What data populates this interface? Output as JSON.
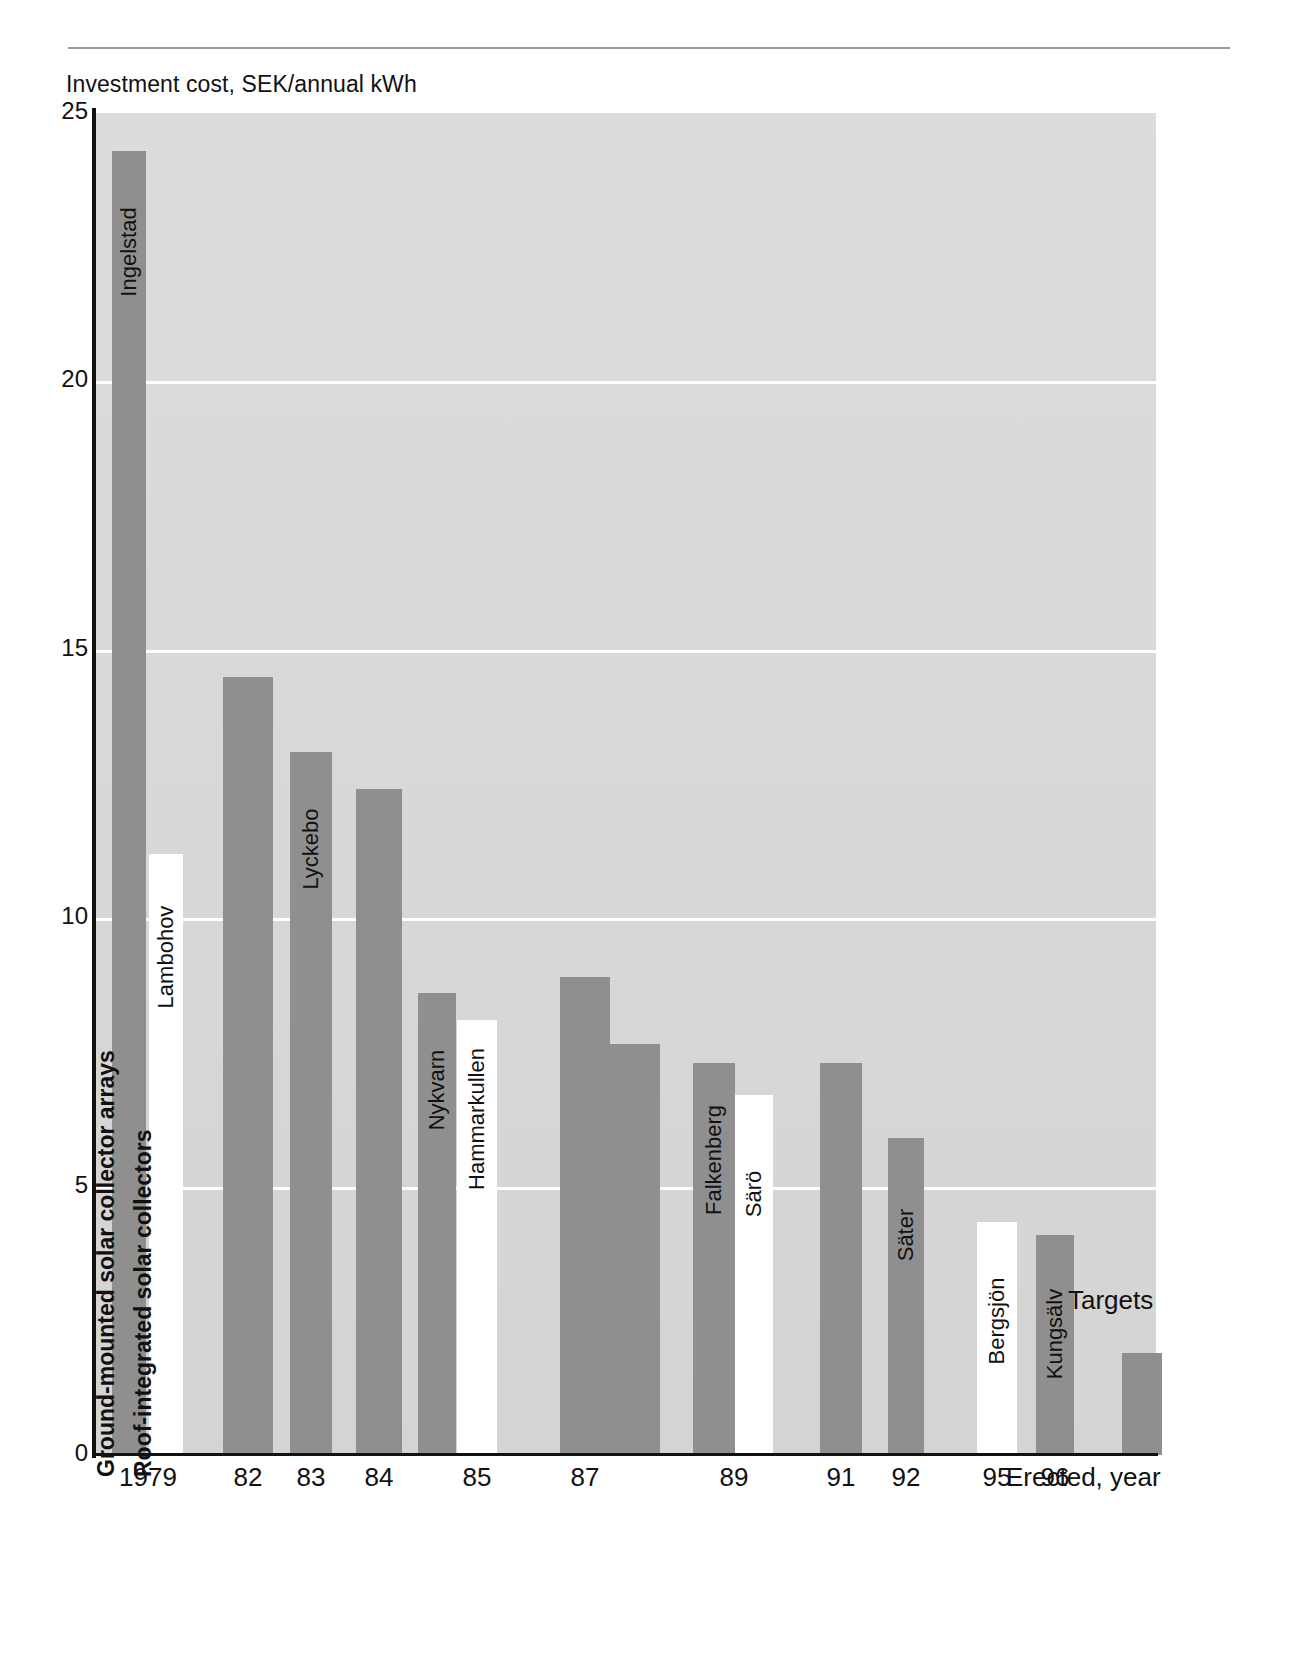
{
  "page": {
    "y_axis_title": "Investment cost, SEK/annual kWh",
    "x_axis_caption": "Erected, year",
    "targets_annotation": "Targets"
  },
  "legend": {
    "ground_label": "Ground-mounted solar collector arrays",
    "roof_label": "Roof-integrated solar collectors",
    "ground_color": "#8f8f8f",
    "roof_color": "#ffffff"
  },
  "chart_data": {
    "type": "bar",
    "title": "",
    "xlabel": "Erected, year",
    "ylabel": "Investment cost, SEK/annual kWh",
    "ylim": [
      0,
      25
    ],
    "yticks": [
      "0",
      "5",
      "10",
      "15",
      "20",
      "25"
    ],
    "ytick_values": [
      0,
      5,
      10,
      15,
      20,
      25
    ],
    "xticks": [
      "1979",
      "82",
      "83",
      "84",
      "85",
      "87",
      "89",
      "91",
      "92",
      "95",
      "96",
      "Erected, year"
    ],
    "grid": true,
    "legend_position": "inside-bars-left",
    "series": [
      {
        "name": "Ground-mounted solar collector arrays",
        "color": "#8f8f8f"
      },
      {
        "name": "Roof-integrated solar collectors",
        "color": "#ffffff"
      }
    ],
    "bars": [
      {
        "label": "Ingelstad",
        "year": "1979",
        "value": 24.3,
        "type": "ground",
        "x": 112,
        "w": 34,
        "label_top": 28
      },
      {
        "label": "Lambohov",
        "year": "1979",
        "value": 11.2,
        "type": "roof",
        "x": 149,
        "w": 34,
        "label_top": 30
      },
      {
        "label": "",
        "year": "82",
        "value": 14.5,
        "type": "ground",
        "x": 223,
        "w": 50,
        "label_top": 0
      },
      {
        "label": "Lyckebo",
        "year": "83",
        "value": 13.1,
        "type": "ground",
        "x": 290,
        "w": 42,
        "label_top": 24
      },
      {
        "label": "",
        "year": "84",
        "value": 12.4,
        "type": "ground",
        "x": 356,
        "w": 46,
        "label_top": 0
      },
      {
        "label": "Nykvarn",
        "year": "85",
        "value": 8.6,
        "type": "ground",
        "x": 418,
        "w": 38,
        "label_top": 24
      },
      {
        "label": "Hammarkullen",
        "year": "85",
        "value": 8.1,
        "type": "roof",
        "x": 457,
        "w": 40,
        "label_top": 26
      },
      {
        "label": "",
        "year": "87",
        "value": 8.9,
        "type": "ground",
        "x": 560,
        "w": 50,
        "label_top": 0
      },
      {
        "label": "",
        "year": "87",
        "value": 7.65,
        "type": "ground",
        "x": 610,
        "w": 50,
        "label_top": 0
      },
      {
        "label": "Falkenberg",
        "year": "89",
        "value": 7.3,
        "type": "ground",
        "x": 693,
        "w": 42,
        "label_top": 24
      },
      {
        "label": "Särö",
        "year": "89",
        "value": 6.7,
        "type": "roof",
        "x": 735,
        "w": 38,
        "label_top": 26
      },
      {
        "label": "",
        "year": "91",
        "value": 7.3,
        "type": "ground",
        "x": 820,
        "w": 42,
        "label_top": 0
      },
      {
        "label": "Säter",
        "year": "92",
        "value": 5.9,
        "type": "ground",
        "x": 888,
        "w": 36,
        "label_top": 24
      },
      {
        "label": "Bergsjön",
        "year": "95",
        "value": 4.35,
        "type": "roof",
        "x": 977,
        "w": 40,
        "label_top": 26
      },
      {
        "label": "Kungsälv",
        "year": "96",
        "value": 4.1,
        "type": "ground",
        "x": 1036,
        "w": 38,
        "label_top": 26
      },
      {
        "label": "",
        "year": "Targets",
        "value": 1.9,
        "type": "ground",
        "x": 1122,
        "w": 40,
        "label_top": 0
      },
      {
        "label": "",
        "year": "Targets",
        "value": 2.5,
        "type": "roof",
        "x": 1162,
        "w": 40,
        "label_top": 0
      }
    ]
  }
}
